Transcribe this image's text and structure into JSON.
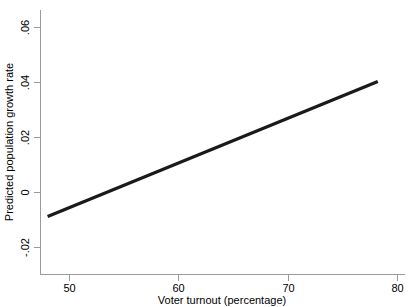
{
  "chart_data": {
    "type": "line",
    "title": "",
    "subtitle": "",
    "xlabel": "Voter turnout (percentage)",
    "ylabel": "Predicted population growth rate",
    "xlim": [
      47.0,
      80.5
    ],
    "ylim": [
      -0.028,
      0.068
    ],
    "xticks": [
      50,
      60,
      70,
      80
    ],
    "xticklabels": [
      "50",
      "60",
      "70",
      "80"
    ],
    "yticks": [
      -0.02,
      0,
      0.02,
      0.04,
      0.06
    ],
    "yticklabels": [
      "-.02",
      "0",
      ".02",
      ".04",
      ".06"
    ],
    "grid": false,
    "legend": false,
    "legend_position": "none",
    "series": [
      {
        "name": "Predicted population growth rate",
        "color": "#1a1a1a",
        "linewidth": 3.2,
        "x": [
          48.0,
          78.2
        ],
        "values": [
          -0.0087,
          0.0404
        ]
      }
    ],
    "annotations": []
  },
  "axes": {
    "x_title": "Voter turnout (percentage)",
    "y_title": "Predicted population growth rate",
    "x_tick_labels": [
      "50",
      "60",
      "70",
      "80"
    ],
    "y_tick_labels": [
      ".06",
      ".04",
      ".02",
      "0",
      "-.02"
    ],
    "axis_color": "#9a9a9a",
    "line_color": "#1a1a1a",
    "background_color": "#ffffff"
  }
}
